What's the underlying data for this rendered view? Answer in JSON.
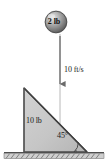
{
  "figure": {
    "background_color": "#ffffff",
    "width": 108,
    "height": 168
  },
  "ball": {
    "label": "2 lb",
    "shape": "sphere",
    "fill_color": "#8c8c8c",
    "highlight_color": "#d8d8d8",
    "edge_color": "#4a4a4a",
    "center_x": 56,
    "center_y": 22,
    "radius": 11
  },
  "velocity": {
    "label": "10 ft/s",
    "direction": "down",
    "arrow_color": "#707070",
    "arrow_x": 60,
    "arrow_top_y": 35,
    "arrow_tip_y": 90
  },
  "drop_line": {
    "color": "#9a9a9a",
    "x": 60,
    "top_y": 34,
    "bottom_y": 152
  },
  "wedge": {
    "label": "10 lb",
    "angle_label": "45°",
    "fill_color": "#c8c8c8",
    "edge_color": "#4a4a4a",
    "shadow_color": "#9b9b9b",
    "apex_x": 24,
    "apex_y": 88,
    "base_left_x": 24,
    "base_right_x": 87,
    "base_y": 152
  },
  "ground": {
    "name": "hatched-ground",
    "line_color": "#555555",
    "hatch_color": "#6e6e6e",
    "surface_y": 152,
    "left_x": 4,
    "right_x": 104,
    "band_height": 6
  },
  "colors": {
    "ink": "#1a1a1a",
    "mid_gray": "#8c8c8c",
    "light_gray": "#c8c8c8"
  }
}
